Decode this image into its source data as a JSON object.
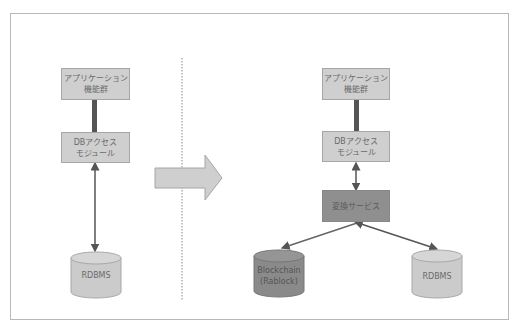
{
  "diagram": {
    "left": {
      "app_box": {
        "line1": "アプリケーション",
        "line2": "機能群"
      },
      "db_access_box": {
        "line1": "DBアクセス",
        "line2": "モジュール"
      },
      "database": {
        "label": "RDBMS"
      }
    },
    "right": {
      "app_box": {
        "line1": "アプリケーション",
        "line2": "機能群"
      },
      "db_access_box": {
        "line1": "DBアクセス",
        "line2": "モジュール"
      },
      "conversion_box": {
        "label": "変換サービス"
      },
      "blockchain_db": {
        "line1": "Blockchain",
        "line2": "(Rablock)"
      },
      "database": {
        "label": "RDBMS"
      }
    },
    "transition_arrow": "right-arrow",
    "colors": {
      "box_fill": "#cfcfcf",
      "dark_box_fill": "#8f8f8f",
      "connector_thick": "#555555",
      "arrow_line": "#666666",
      "cylinder_light": "#cbcbcb",
      "cylinder_dark": "#8a8a8a"
    }
  }
}
